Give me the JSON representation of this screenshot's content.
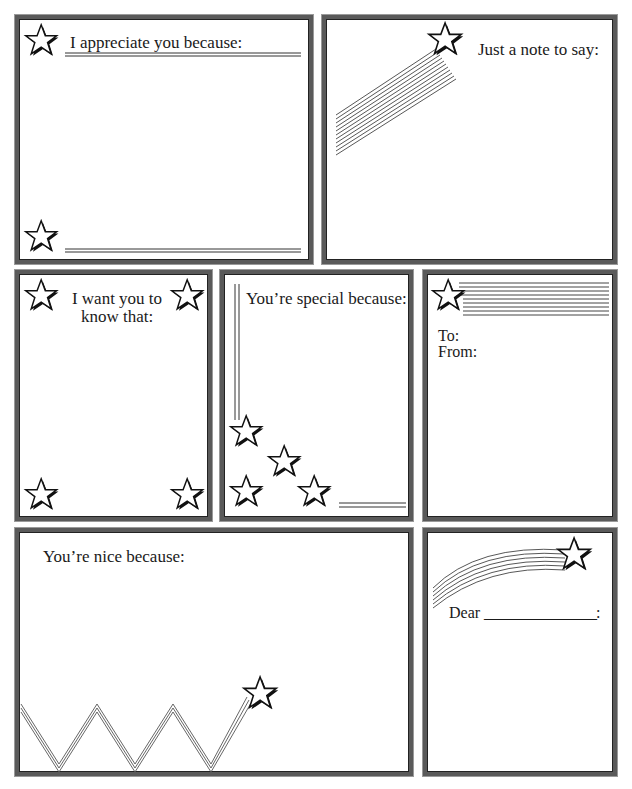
{
  "page": {
    "background": "#ffffff",
    "border_color": "#5a5a5a"
  },
  "cards": [
    {
      "id": "appreciate",
      "heading": "I appreciate you because:",
      "decoration": "two stars with double rules"
    },
    {
      "id": "just-a-note",
      "heading": "Just a note to say:",
      "decoration": "shooting star with diagonal stripes"
    },
    {
      "id": "want-you-to-know",
      "heading_line1": "I want you to",
      "heading_line2": "know that:",
      "decoration": "four corner stars"
    },
    {
      "id": "special",
      "heading": "You’re special because:",
      "decoration": "vertical double rule and four stars"
    },
    {
      "id": "to-from",
      "to_label": "To:",
      "from_label": "From:",
      "decoration": "star with horizontal stripe band"
    },
    {
      "id": "nice",
      "heading": "You’re nice because:",
      "decoration": "zigzag trail ending in star"
    },
    {
      "id": "dear",
      "dear_label": "Dear",
      "blank": "________________",
      "colon": ":",
      "decoration": "curved shooting star"
    }
  ]
}
